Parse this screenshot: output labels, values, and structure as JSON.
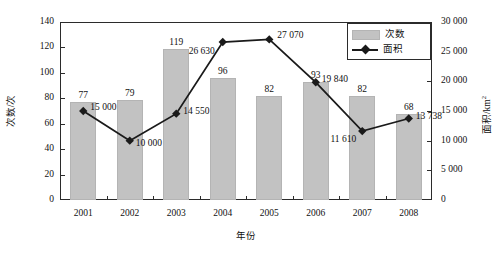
{
  "chart_data": {
    "type": "bar",
    "title": "",
    "xlabel": "年份",
    "ylabel": "次数/次",
    "y2label": "面积/km",
    "y2label_sup": "2",
    "categories": [
      "2001",
      "2002",
      "2003",
      "2004",
      "2005",
      "2006",
      "2007",
      "2008"
    ],
    "ylim": [
      0,
      140
    ],
    "y2lim": [
      0,
      30000
    ],
    "yticks": [
      "0",
      "20",
      "40",
      "60",
      "80",
      "100",
      "120",
      "140"
    ],
    "y2ticks": [
      "0",
      "5 000",
      "10 000",
      "15 000",
      "20 000",
      "25 000",
      "30 000"
    ],
    "grid": false,
    "legend_position": "top-right",
    "series": [
      {
        "name": "次数",
        "kind": "bar",
        "axis": "left",
        "color": "#c2c2c2",
        "values": [
          77,
          79,
          119,
          96,
          82,
          93,
          82,
          68
        ],
        "labels": [
          "77",
          "79",
          "119",
          "96",
          "82",
          "93",
          "82",
          "68"
        ]
      },
      {
        "name": "面积",
        "kind": "line",
        "axis": "right",
        "color": "#1a1a1a",
        "values": [
          15000,
          10000,
          14550,
          26630,
          27070,
          19840,
          11610,
          13738
        ],
        "labels": [
          "15 000",
          "10 000",
          "14 550",
          "26 630",
          "27 070",
          "19 840",
          "11 610",
          "13 738"
        ]
      }
    ]
  },
  "legend": {
    "items": [
      {
        "label": "次数"
      },
      {
        "label": "面积"
      }
    ]
  }
}
